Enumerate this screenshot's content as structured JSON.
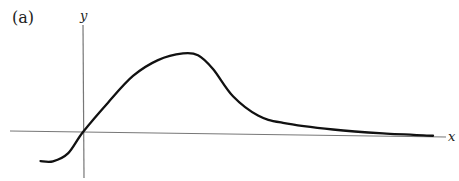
{
  "panel_label": "(a)",
  "axes": {
    "x_label": "x",
    "y_label": "y"
  },
  "colors": {
    "curve": "#111111",
    "axis": "#777777",
    "text": "#222222"
  },
  "chart_data": {
    "type": "line",
    "title": "",
    "panel": "(a)",
    "xlabel": "x",
    "ylabel": "y",
    "grid": false,
    "xlim": [
      -1,
      7.5
    ],
    "ylim": [
      -0.9,
      1.6
    ],
    "series": [
      {
        "name": "curve",
        "x": [
          -0.85,
          -0.6,
          -0.3,
          0,
          0.5,
          1.0,
          1.5,
          2.0,
          2.3,
          2.6,
          3.0,
          3.5,
          4.0,
          5.0,
          6.0,
          7.0
        ],
        "y": [
          -0.55,
          -0.55,
          -0.4,
          0,
          0.55,
          1.05,
          1.35,
          1.48,
          1.45,
          1.2,
          0.7,
          0.35,
          0.22,
          0.11,
          0.05,
          0.02
        ]
      }
    ]
  }
}
